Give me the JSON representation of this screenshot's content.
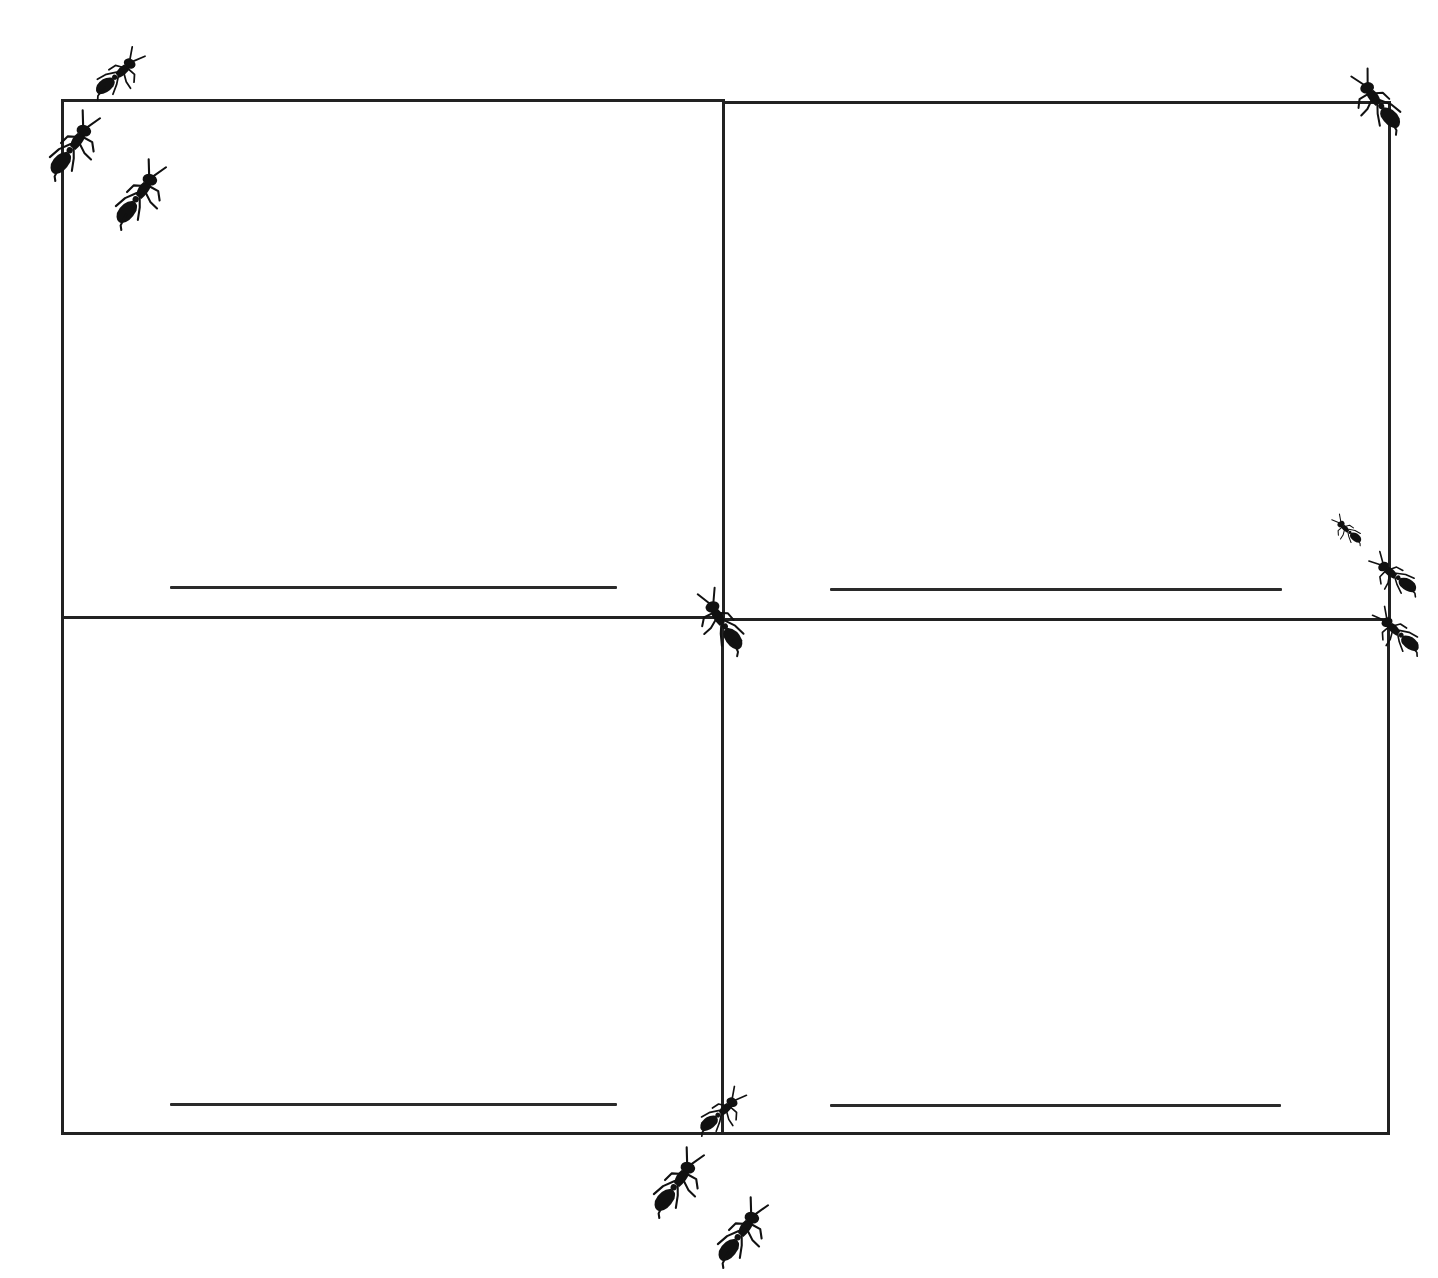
{
  "worksheet": {
    "layout": "2x2 grid",
    "colors": {
      "background": "#ffffff",
      "lines": "#222222",
      "ant": "#111111"
    },
    "cells": [
      {
        "position": "top-left",
        "writing_line": true,
        "text": ""
      },
      {
        "position": "top-right",
        "writing_line": true,
        "text": ""
      },
      {
        "position": "bottom-left",
        "writing_line": true,
        "text": ""
      },
      {
        "position": "bottom-right",
        "writing_line": true,
        "text": ""
      }
    ],
    "decorations": {
      "icon": "ant-icon",
      "count": 12
    }
  }
}
